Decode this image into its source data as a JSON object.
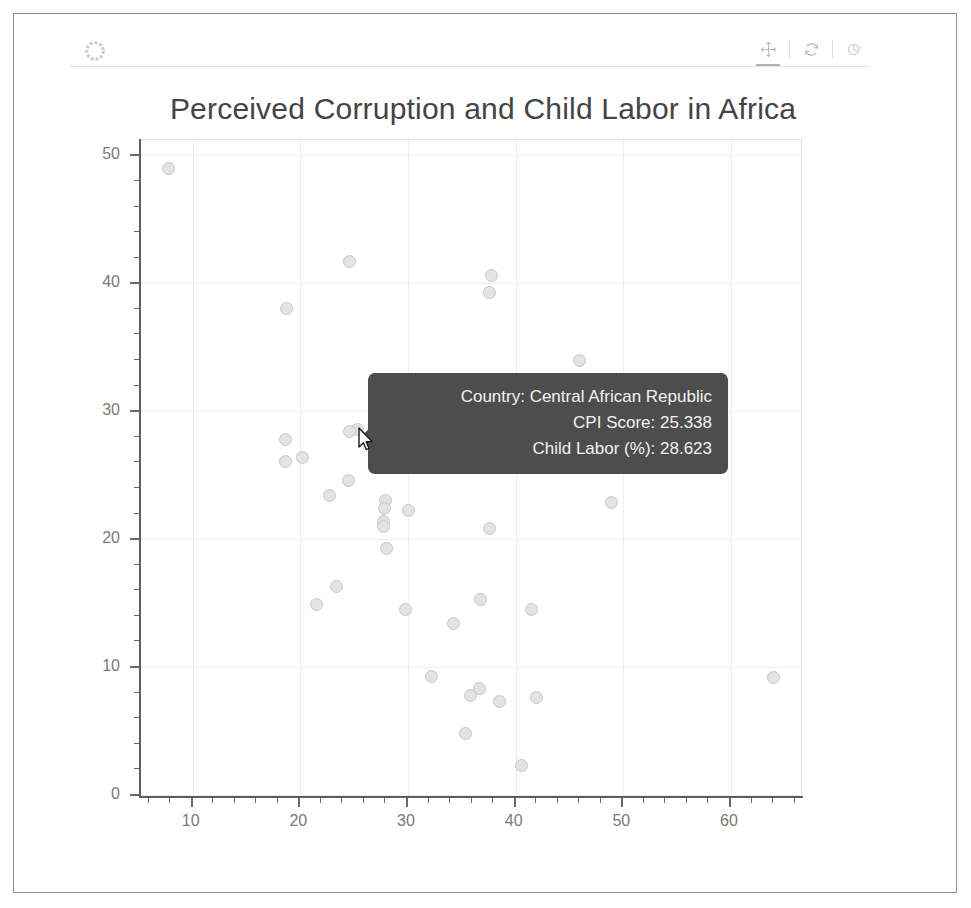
{
  "app": {
    "logo_icon": "bokeh-logo-icon"
  },
  "toolbar": {
    "tools": [
      {
        "name": "pan-tool",
        "icon": "move-cross-icon",
        "label": "Pan",
        "active": true
      },
      {
        "name": "reset-tool",
        "icon": "reset-circular-icon",
        "label": "Reset",
        "active": false
      },
      {
        "name": "save-tool",
        "icon": "save-disc-icon",
        "label": "Save",
        "active": false
      }
    ]
  },
  "chart_data": {
    "type": "scatter",
    "title": "Perceived Corruption and Child Labor in Africa",
    "xlabel": "",
    "ylabel": "",
    "xlim": [
      5.2,
      66.5
    ],
    "ylim": [
      0,
      51.2
    ],
    "grid": true,
    "legend": null,
    "x_ticks_major": [
      10,
      20,
      30,
      40,
      50,
      60
    ],
    "y_ticks_major": [
      0,
      10,
      20,
      30,
      40,
      50
    ],
    "x_tick_labels": [
      "10",
      "20",
      "30",
      "40",
      "50",
      "60"
    ],
    "y_tick_labels": [
      "0",
      "10",
      "20",
      "30",
      "40",
      "50"
    ],
    "x_minor_step": 2,
    "y_minor_step": 2,
    "marker": {
      "shape": "circle",
      "fill": "#e3e3e3",
      "line": "#c8c8c8",
      "size": 13
    },
    "series_name": "African countries",
    "x_field": "CPI Score",
    "y_field": "Child Labor (%)",
    "points": [
      {
        "x": 7.8,
        "y": 49.0
      },
      {
        "x": 24.6,
        "y": 41.7
      },
      {
        "x": 37.8,
        "y": 40.6
      },
      {
        "x": 37.6,
        "y": 39.3
      },
      {
        "x": 18.7,
        "y": 38.0
      },
      {
        "x": 45.9,
        "y": 34.0
      },
      {
        "x": 25.3,
        "y": 28.6
      },
      {
        "x": 24.6,
        "y": 28.4
      },
      {
        "x": 18.6,
        "y": 27.8
      },
      {
        "x": 20.2,
        "y": 26.4
      },
      {
        "x": 18.6,
        "y": 26.1
      },
      {
        "x": 24.5,
        "y": 24.6
      },
      {
        "x": 22.7,
        "y": 23.4
      },
      {
        "x": 27.9,
        "y": 23.0
      },
      {
        "x": 27.8,
        "y": 22.4
      },
      {
        "x": 30.0,
        "y": 22.2
      },
      {
        "x": 48.9,
        "y": 22.9
      },
      {
        "x": 27.7,
        "y": 21.4
      },
      {
        "x": 27.7,
        "y": 21.0
      },
      {
        "x": 37.6,
        "y": 20.8
      },
      {
        "x": 28.0,
        "y": 19.3
      },
      {
        "x": 23.4,
        "y": 16.3
      },
      {
        "x": 36.7,
        "y": 15.3
      },
      {
        "x": 21.5,
        "y": 14.9
      },
      {
        "x": 41.5,
        "y": 14.5
      },
      {
        "x": 29.8,
        "y": 14.5
      },
      {
        "x": 34.2,
        "y": 13.4
      },
      {
        "x": 32.2,
        "y": 9.3
      },
      {
        "x": 63.9,
        "y": 9.2
      },
      {
        "x": 36.6,
        "y": 8.3
      },
      {
        "x": 35.8,
        "y": 7.8
      },
      {
        "x": 41.9,
        "y": 7.6
      },
      {
        "x": 38.5,
        "y": 7.3
      },
      {
        "x": 35.3,
        "y": 4.8
      },
      {
        "x": 40.5,
        "y": 2.3
      }
    ]
  },
  "tooltip": {
    "visible": true,
    "rows": [
      "Country: Central African Republic",
      "CPI Score: 25.338",
      "Child Labor (%): 28.623"
    ],
    "background": "#4d4d4d",
    "text_color": "#f2f2f2"
  },
  "cursor": {
    "icon": "mouse-pointer-icon",
    "x": 357,
    "y": 427
  }
}
